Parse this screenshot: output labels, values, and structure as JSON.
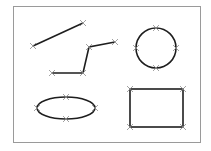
{
  "canvas": {
    "width": 211,
    "height": 151,
    "background": "#ffffff"
  },
  "frame": {
    "x": 13.5,
    "y": 6.5,
    "width": 187,
    "height": 136,
    "stroke": "#9a9a9a"
  },
  "colors": {
    "shape_stroke": "#1e1e1e",
    "marker": "#8a8a8a"
  },
  "shapes": {
    "line": {
      "points": [
        [
          33,
          46
        ],
        [
          83,
          23
        ]
      ]
    },
    "polyline": {
      "points": [
        [
          52,
          73
        ],
        [
          83,
          73
        ],
        [
          89,
          47
        ],
        [
          115,
          42
        ]
      ]
    },
    "circle": {
      "cx": 156,
      "cy": 48,
      "r": 20
    },
    "ellipse": {
      "cx": 66,
      "cy": 108,
      "rx": 29,
      "ry": 11
    },
    "rectangle": {
      "x": 130,
      "y": 89,
      "width": 53,
      "height": 38
    }
  },
  "markers": [
    [
      33,
      46
    ],
    [
      83,
      23
    ],
    [
      52,
      73
    ],
    [
      83,
      73
    ],
    [
      89,
      47
    ],
    [
      115,
      42
    ],
    [
      156,
      28
    ],
    [
      136,
      48
    ],
    [
      176,
      48
    ],
    [
      156,
      68
    ],
    [
      37,
      108
    ],
    [
      95,
      108
    ],
    [
      66,
      97
    ],
    [
      66,
      119
    ],
    [
      130,
      89
    ],
    [
      183,
      89
    ],
    [
      130,
      127
    ],
    [
      183,
      127
    ]
  ]
}
